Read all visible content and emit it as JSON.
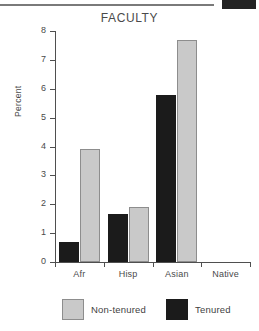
{
  "artifacts": {
    "top_rule": "horizontal-rule",
    "top_block": "dark-scan-block"
  },
  "chart_data": {
    "type": "bar",
    "title": "FACULTY",
    "xlabel": "",
    "ylabel": "Percent",
    "categories": [
      "Afr",
      "Hisp",
      "Asian",
      "Native"
    ],
    "series": [
      {
        "name": "Tenured",
        "color": "#1b1b1b",
        "values": [
          0.7,
          1.65,
          5.8,
          0.0
        ]
      },
      {
        "name": "Non-tenured",
        "color": "#c9c9c9",
        "values": [
          3.9,
          1.9,
          7.7,
          0.0
        ]
      }
    ],
    "ylim": [
      0,
      8
    ],
    "yticks": [
      0,
      1,
      2,
      3,
      4,
      5,
      6,
      7,
      8
    ],
    "ytick_labels": [
      "0",
      "1",
      "2",
      "3",
      "4",
      "5",
      "6",
      "7",
      "8"
    ],
    "grid": false,
    "legend_position": "bottom",
    "legend_order": [
      "Non-tenured",
      "Tenured"
    ]
  }
}
